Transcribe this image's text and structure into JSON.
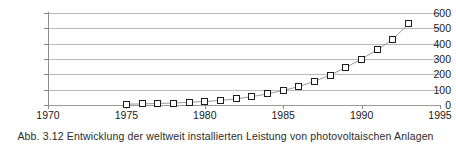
{
  "caption": "Abb. 3.12  Entwicklung der weltweit installierten Leistung von photovoltaischen Anlagen",
  "chart_data": {
    "type": "line",
    "title": "",
    "xlabel": "",
    "ylabel": "",
    "xlim": [
      1970,
      1995
    ],
    "ylim": [
      0,
      600
    ],
    "grid": true,
    "legend": false,
    "marker": "open-square",
    "line_color": "#9a9a9a",
    "marker_edge_color": "#1d1d1d",
    "marker_face_color": "#ffffff",
    "xticks": [
      1970,
      1975,
      1980,
      1985,
      1990,
      1995
    ],
    "xtick_labels": [
      "1970",
      "1975",
      "1980",
      "1985",
      "1990",
      "1995"
    ],
    "yticks": [
      0,
      100,
      200,
      300,
      400,
      500,
      600
    ],
    "ytick_labels": [
      "0",
      "100",
      "200",
      "300",
      "400",
      "500",
      "600"
    ],
    "x": [
      1975,
      1976,
      1977,
      1978,
      1979,
      1980,
      1981,
      1982,
      1983,
      1984,
      1985,
      1986,
      1987,
      1988,
      1989,
      1990,
      1991,
      1992,
      1993
    ],
    "values": [
      5,
      7,
      10,
      13,
      18,
      23,
      30,
      40,
      55,
      72,
      95,
      120,
      155,
      195,
      245,
      300,
      360,
      430,
      530
    ]
  }
}
